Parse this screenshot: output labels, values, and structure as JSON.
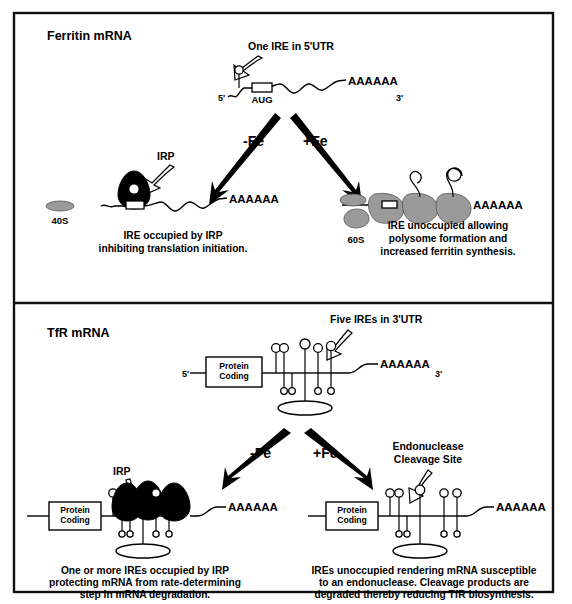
{
  "figure": {
    "background": "#ffffff",
    "border_color": "#111111",
    "ribosome_color": "#9a9a9a",
    "irp_color": "#000000"
  },
  "panels": [
    {
      "id": "ferritin",
      "title": "Ferritin mRNA",
      "top_callout": "One IRE in 5'UTR",
      "five_prime": "5'",
      "three_prime": "3'",
      "poly_a": "AAAAAA",
      "start_codon": "AUG",
      "branches": [
        {
          "id": "minus-fe",
          "label": "-Fe",
          "protein_label": "IRP",
          "subunit_label": "40S",
          "poly_a": "AAAAAA",
          "caption_lines": [
            "IRE occupied by IRP",
            "inhibiting translation initiation."
          ]
        },
        {
          "id": "plus-fe",
          "label": "+Fe",
          "subunit_label": "60S",
          "poly_a": "AAAAAA",
          "caption_lines": [
            "IRE unoccupied allowing",
            "polysome formation and",
            "increased ferritin synthesis."
          ]
        }
      ]
    },
    {
      "id": "tfr",
      "title": "TfR mRNA",
      "top_callout": "Five IREs in 3'UTR",
      "five_prime": "5'",
      "three_prime": "3'",
      "poly_a": "AAAAAA",
      "coding_box_lines": [
        "Protein",
        "Coding"
      ],
      "ire_count": 5,
      "branches": [
        {
          "id": "minus-fe",
          "label": "-Fe",
          "protein_label": "IRP",
          "poly_a": "AAAAAA",
          "coding_box_lines": [
            "Protein",
            "Coding"
          ],
          "caption_lines": [
            "One or more IREs occupied by IRP",
            "protecting mRNA from rate-determining",
            "step in mRNA degradation."
          ]
        },
        {
          "id": "plus-fe",
          "label": "+Fe",
          "callout_lines": [
            "Endonuclease",
            "Cleavage Site"
          ],
          "poly_a": "AAAAAA",
          "coding_box_lines": [
            "Protein",
            "Coding"
          ],
          "caption_lines": [
            "IREs unoccupied rendering mRNA susceptible",
            "to an endonuclease.  Cleavage products are",
            "degraded thereby reducing TfR biosynthesis."
          ]
        }
      ]
    }
  ]
}
